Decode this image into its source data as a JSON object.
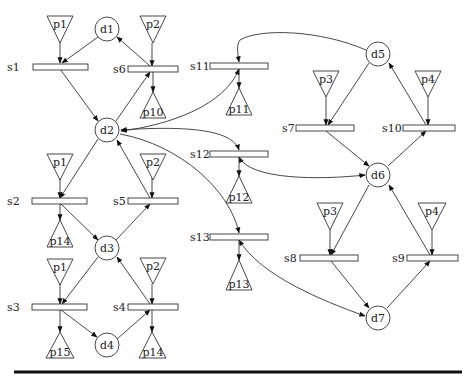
{
  "diagram": {
    "type": "petri-net",
    "places": [
      {
        "id": "d1",
        "label": "d1",
        "cx": 107,
        "cy": 29
      },
      {
        "id": "d2",
        "label": "d2",
        "cx": 107,
        "cy": 130
      },
      {
        "id": "d3",
        "label": "d3",
        "cx": 107,
        "cy": 248
      },
      {
        "id": "d4",
        "label": "d4",
        "cx": 107,
        "cy": 345
      },
      {
        "id": "d5",
        "label": "d5",
        "cx": 378,
        "cy": 54
      },
      {
        "id": "d6",
        "label": "d6",
        "cx": 378,
        "cy": 175
      },
      {
        "id": "d7",
        "label": "d7",
        "cx": 378,
        "cy": 318
      }
    ],
    "transitions": [
      {
        "id": "s1",
        "label": "s1"
      },
      {
        "id": "s2",
        "label": "s2"
      },
      {
        "id": "s3",
        "label": "s3"
      },
      {
        "id": "s4",
        "label": "s4"
      },
      {
        "id": "s5",
        "label": "s5"
      },
      {
        "id": "s6",
        "label": "s6"
      },
      {
        "id": "s7",
        "label": "s7"
      },
      {
        "id": "s8",
        "label": "s8"
      },
      {
        "id": "s9",
        "label": "s9"
      },
      {
        "id": "s10",
        "label": "s10"
      },
      {
        "id": "s11",
        "label": "s11"
      },
      {
        "id": "s12",
        "label": "s12"
      },
      {
        "id": "s13",
        "label": "s13"
      }
    ],
    "inputs": [
      {
        "label": "p1",
        "to": "s1"
      },
      {
        "label": "p2",
        "to": "s6"
      },
      {
        "label": "p1",
        "to": "s2"
      },
      {
        "label": "p2",
        "to": "s5"
      },
      {
        "label": "p1",
        "to": "s3"
      },
      {
        "label": "p2",
        "to": "s4"
      },
      {
        "label": "p3",
        "to": "s7"
      },
      {
        "label": "p4",
        "to": "s10"
      },
      {
        "label": "p3",
        "to": "s8"
      },
      {
        "label": "p4",
        "to": "s9"
      }
    ],
    "outputs": [
      {
        "label": "p10",
        "from": "s6"
      },
      {
        "label": "p14",
        "from": "s2"
      },
      {
        "label": "p15",
        "from": "s3"
      },
      {
        "label": "p14",
        "from": "s4"
      },
      {
        "label": "p11",
        "from": "s11"
      },
      {
        "label": "p12",
        "from": "s12"
      },
      {
        "label": "p13",
        "from": "s13"
      }
    ],
    "arcs": [
      [
        "p1",
        "s1"
      ],
      [
        "d1",
        "s1"
      ],
      [
        "s1",
        "d2"
      ],
      [
        "p2",
        "s6"
      ],
      [
        "d2",
        "s6"
      ],
      [
        "s6",
        "d1"
      ],
      [
        "s6",
        "p10"
      ],
      [
        "d2",
        "s2"
      ],
      [
        "p1",
        "s2"
      ],
      [
        "s2",
        "p14"
      ],
      [
        "s2",
        "d3"
      ],
      [
        "p2",
        "s5"
      ],
      [
        "d3",
        "s5"
      ],
      [
        "s5",
        "d2"
      ],
      [
        "d3",
        "s3"
      ],
      [
        "p1",
        "s3"
      ],
      [
        "s3",
        "p15"
      ],
      [
        "s3",
        "d4"
      ],
      [
        "p2",
        "s4"
      ],
      [
        "d4",
        "s4"
      ],
      [
        "s4",
        "d3"
      ],
      [
        "s4",
        "p14"
      ],
      [
        "d5",
        "s11"
      ],
      [
        "s11",
        "d2"
      ],
      [
        "s11",
        "p11"
      ],
      [
        "d2",
        "s12"
      ],
      [
        "s12",
        "d2"
      ],
      [
        "d6",
        "s12"
      ],
      [
        "s12",
        "d6"
      ],
      [
        "s12",
        "p12"
      ],
      [
        "d2",
        "s13"
      ],
      [
        "d7",
        "s13"
      ],
      [
        "s13",
        "d7"
      ],
      [
        "s13",
        "p13"
      ],
      [
        "d5",
        "s7"
      ],
      [
        "p3",
        "s7"
      ],
      [
        "s7",
        "d6"
      ],
      [
        "p4",
        "s10"
      ],
      [
        "d6",
        "s10"
      ],
      [
        "s10",
        "d5"
      ],
      [
        "d6",
        "s8"
      ],
      [
        "p3",
        "s8"
      ],
      [
        "s8",
        "d7"
      ],
      [
        "p4",
        "s9"
      ],
      [
        "d7",
        "s9"
      ],
      [
        "s9",
        "d6"
      ]
    ]
  }
}
